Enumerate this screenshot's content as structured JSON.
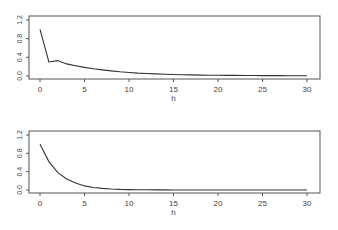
{
  "chart_data": [
    {
      "type": "line",
      "title": "",
      "xlabel": "h",
      "ylabel": "",
      "xlim": [
        0,
        30
      ],
      "ylim": [
        0.0,
        1.2
      ],
      "xticks": [
        "0",
        "5",
        "10",
        "15",
        "20",
        "25",
        "30"
      ],
      "yticks": [
        "0.0",
        "0.4",
        "0.8",
        "1.2"
      ],
      "grid": false,
      "x": [
        0,
        1,
        2,
        3,
        4,
        5,
        6,
        7,
        8,
        9,
        10,
        11,
        12,
        13,
        14,
        15,
        16,
        17,
        18,
        19,
        20,
        21,
        22,
        23,
        24,
        25,
        26,
        27,
        28,
        29,
        30
      ],
      "values": [
        1.0,
        0.3,
        0.33,
        0.26,
        0.22,
        0.185,
        0.155,
        0.13,
        0.11,
        0.09,
        0.075,
        0.063,
        0.053,
        0.045,
        0.038,
        0.032,
        0.027,
        0.023,
        0.02,
        0.017,
        0.015,
        0.013,
        0.012,
        0.011,
        0.01,
        0.009,
        0.008,
        0.008,
        0.007,
        0.007,
        0.006
      ]
    },
    {
      "type": "line",
      "title": "",
      "xlabel": "h",
      "ylabel": "",
      "xlim": [
        0,
        30
      ],
      "ylim": [
        0.0,
        1.2
      ],
      "xticks": [
        "0",
        "5",
        "10",
        "15",
        "20",
        "25",
        "30"
      ],
      "yticks": [
        "0.0",
        "0.4",
        "0.8",
        "1.2"
      ],
      "grid": false,
      "x": [
        0,
        1,
        2,
        3,
        4,
        5,
        6,
        7,
        8,
        9,
        10,
        11,
        12,
        13,
        14,
        15,
        16,
        17,
        18,
        19,
        20,
        21,
        22,
        23,
        24,
        25,
        26,
        27,
        28,
        29,
        30
      ],
      "values": [
        1.0,
        0.62,
        0.38,
        0.24,
        0.15,
        0.09,
        0.055,
        0.035,
        0.022,
        0.014,
        0.009,
        0.006,
        0.004,
        0.003,
        0.002,
        0.001,
        0.001,
        0.001,
        0,
        0,
        0,
        0,
        0,
        0,
        0,
        0,
        0,
        0,
        0,
        0,
        0
      ]
    }
  ]
}
